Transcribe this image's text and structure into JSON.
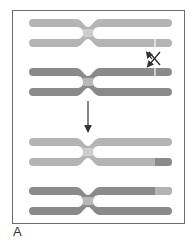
{
  "figure": {
    "panel_label": "A",
    "colors": {
      "light_chromatid": "#b4b4b4",
      "dark_chromatid": "#8a8a8a",
      "centromere": "#cdcdcd",
      "frame": "#6b6b6b",
      "arrow": "#444444"
    },
    "stages": [
      {
        "name": "before-crossover",
        "pairs": [
          "light-homolog",
          "dark-homolog"
        ],
        "break_marks": true,
        "exchange_symbol": "X"
      },
      {
        "name": "after-crossover",
        "pairs": [
          "light-homolog-with-dark-tip",
          "dark-homolog-with-light-tip"
        ]
      }
    ]
  }
}
